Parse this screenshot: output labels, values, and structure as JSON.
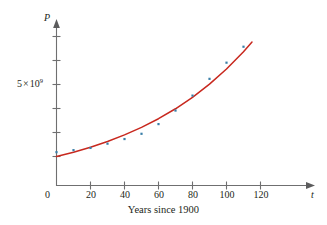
{
  "chart_data": {
    "type": "scatter",
    "title": "",
    "subtitle": "",
    "caption": "Years since 1900",
    "xlabel": "t",
    "ylabel": "P",
    "x_axis_name": "t",
    "y_axis_name": "P",
    "xlim": [
      0,
      128
    ],
    "ylim": [
      0,
      9600000000
    ],
    "xticks": [
      0,
      20,
      40,
      60,
      80,
      100,
      120
    ],
    "xtick_labels": [
      "0",
      "20",
      "40",
      "60",
      "80",
      "100",
      "120"
    ],
    "yticks": [
      5000000000
    ],
    "ytick_labels": [
      "5 × 10⁹"
    ],
    "ytick_label_parts": {
      "mantissa": "5",
      "times": "×",
      "base": "10",
      "exponent": "9"
    },
    "origin_label": "0",
    "grid": false,
    "legend": false,
    "legend_position": "none",
    "series": [
      {
        "name": "World population data",
        "type": "scatter",
        "color": "#3a7fa8",
        "marker": "square-dot",
        "x": [
          0,
          10,
          20,
          30,
          40,
          50,
          60,
          70,
          80,
          90,
          100,
          110
        ],
        "y": [
          1650000000,
          1750000000,
          1860000000,
          2070000000,
          2300000000,
          2560000000,
          3040000000,
          3710000000,
          4450000000,
          5280000000,
          6080000000,
          6870000000
        ]
      },
      {
        "name": "Exponential model",
        "type": "line",
        "color": "#c8281e",
        "x": [
          0,
          10,
          20,
          30,
          40,
          50,
          60,
          70,
          80,
          90,
          100,
          110,
          115
        ],
        "y": [
          1436000000,
          1650000000,
          1896000000,
          2179000000,
          2504000000,
          2877000000,
          3306000000,
          3799000000,
          4366000000,
          5017000000,
          5765000000,
          6624000000,
          7100000000
        ]
      }
    ]
  },
  "axis": {
    "y_name": "P",
    "x_name": "t",
    "origin": "0",
    "y_tick_mantissa": "5",
    "y_tick_times": "×",
    "y_tick_base": "10",
    "y_tick_exponent": "9"
  },
  "x_tick_labels": [
    "0",
    "20",
    "40",
    "60",
    "80",
    "100",
    "120"
  ],
  "caption": {
    "text": "Years since 1900"
  }
}
